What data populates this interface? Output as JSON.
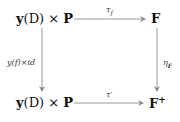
{
  "diagram": {
    "type": "commutative-square",
    "nodes": {
      "top_left": {
        "bold_y": "y",
        "paren": "(D) × ",
        "bold_p": "P"
      },
      "top_right": {
        "text": "F"
      },
      "bottom_left": {
        "bold_y": "y",
        "paren": "(D) × ",
        "bold_p": "P"
      },
      "bottom_right": {
        "text": "F",
        "sup": "+"
      }
    },
    "arrows": {
      "top": {
        "label": "τ",
        "sub": "f"
      },
      "bottom": {
        "label": "τ′"
      },
      "left": {
        "label": "y(f)×id"
      },
      "right": {
        "label": "η",
        "sub": "F"
      }
    },
    "colors": {
      "line": "#888888",
      "text": "#111111"
    }
  }
}
